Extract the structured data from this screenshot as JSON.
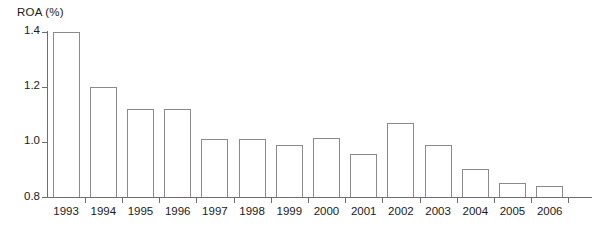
{
  "chart_data": {
    "type": "bar",
    "title": "ROA (%)",
    "xlabel": "",
    "ylabel": "ROA (%)",
    "ylim": [
      0.8,
      1.4
    ],
    "ytick_labels": [
      "1.4",
      "1.2",
      "1.0",
      "0.8"
    ],
    "yticks": [
      1.4,
      1.2,
      1.0,
      0.8
    ],
    "grid": false,
    "legend": null,
    "categories": [
      "1993",
      "1994",
      "1995",
      "1996",
      "1997",
      "1998",
      "1999",
      "2000",
      "2001",
      "2002",
      "2003",
      "2004",
      "2005",
      "2006"
    ],
    "values": [
      1.4,
      1.2,
      1.12,
      1.12,
      1.01,
      1.01,
      0.99,
      1.015,
      0.955,
      1.07,
      0.99,
      0.9,
      0.85,
      0.84
    ],
    "series": [
      {
        "name": "ROA (%)",
        "values": [
          1.4,
          1.2,
          1.12,
          1.12,
          1.01,
          1.01,
          0.99,
          1.015,
          0.955,
          1.07,
          0.99,
          0.9,
          0.85,
          0.84
        ]
      }
    ]
  },
  "style": {
    "bar_fill": "#ffffff",
    "bar_stroke": "#8a8a8a",
    "axis_color": "#6e6e6e",
    "text_color": "#1a1a1a",
    "background": "#ffffff"
  }
}
